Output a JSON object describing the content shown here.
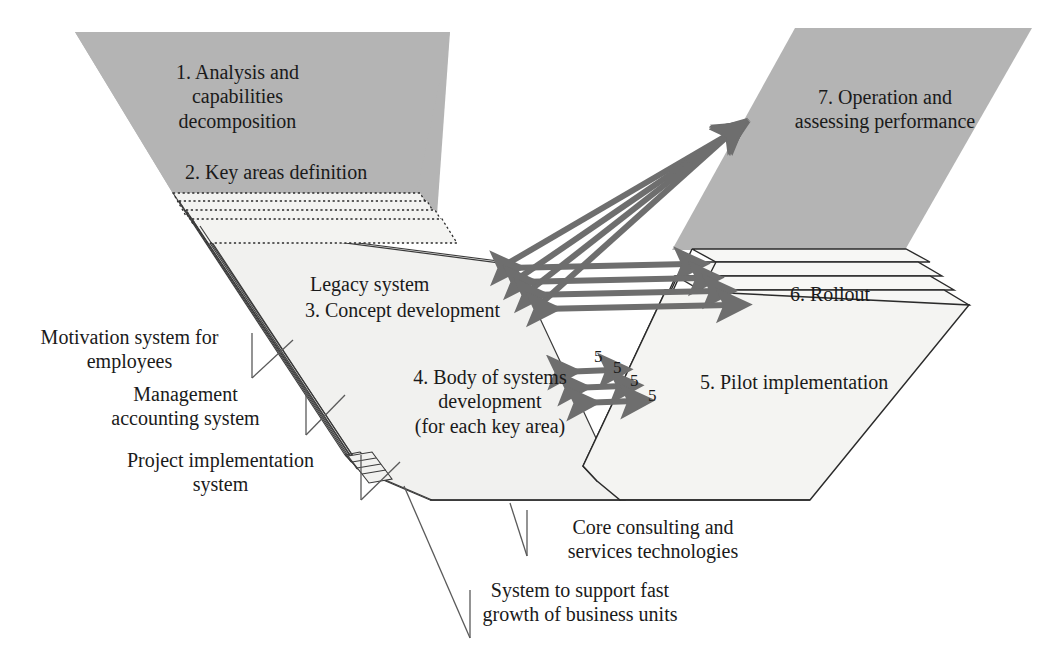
{
  "diagram": {
    "background_color": "#ffffff",
    "panel_gray": "#b4b4b4",
    "panel_light": "#f1f1ef",
    "arrow_color": "#6e6e6e",
    "outline_color": "#3a3a3a",
    "text_color": "#1a1a1a",
    "stages": [
      {
        "id": "stage-1",
        "label": "1. Analysis and\ncapabilities\ndecomposition",
        "panel": "left-gray"
      },
      {
        "id": "stage-2",
        "label": "2. Key areas definition",
        "panel": "left-gray"
      },
      {
        "id": "stage-3",
        "label": "3. Concept development",
        "panel": "left-light"
      },
      {
        "id": "stage-4",
        "label": "4. Body of systems\ndevelopment\n(for each key area)",
        "panel": "left-light"
      },
      {
        "id": "stage-5",
        "label": "5. Pilot implementation",
        "panel": "right-stack"
      },
      {
        "id": "stage-6",
        "label": "6. Rollout",
        "panel": "right-stack"
      },
      {
        "id": "stage-7",
        "label": "7. Operation and\nassessing performance",
        "panel": "right-gray"
      }
    ],
    "legacy_label": "Legacy system",
    "left_callouts": [
      {
        "id": "callout-motivation",
        "label": "Motivation system for\nemployees"
      },
      {
        "id": "callout-management-accounting",
        "label": "Management\naccounting system"
      },
      {
        "id": "callout-project-implementation",
        "label": "Project implementation\nsystem"
      }
    ],
    "bottom_callouts": [
      {
        "id": "callout-core-consulting",
        "label": "Core consulting and\nservices technologies"
      },
      {
        "id": "callout-fast-growth",
        "label": "System to support  fast\ngrowth  of business units"
      }
    ],
    "pilot_layer_markers": [
      "5",
      "5",
      "5",
      "5"
    ],
    "arrow_counts": {
      "converging_to_operation": 4,
      "horizontal_bidirectional": 4,
      "lower_bidirectional": 3
    }
  }
}
